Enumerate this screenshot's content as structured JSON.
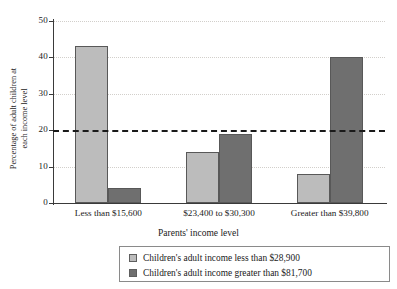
{
  "chart_data": {
    "type": "bar",
    "title": "",
    "xlabel": "Parents' income level",
    "ylabel": "Percentage of adult children at each income level",
    "ylabel_line1": "Percentage of adult children at",
    "ylabel_line2": "each income level",
    "categories": [
      "Less than $15,600",
      "$23,400 to $30,300",
      "Greater than $39,800"
    ],
    "series": [
      {
        "name": "Children's adult income less than $28,900",
        "color": "#bcbcbc",
        "values": [
          43,
          14,
          8
        ]
      },
      {
        "name": "Children's adult income greater than $81,700",
        "color": "#6f6f6f",
        "values": [
          4,
          19,
          40
        ]
      }
    ],
    "ylim": [
      0,
      50
    ],
    "yticks": [
      0,
      10,
      20,
      30,
      40,
      50
    ],
    "ytick_labels": [
      "0",
      "10",
      "20",
      "30",
      "40",
      "50"
    ],
    "grid": true,
    "reference_line": 20,
    "legend_position": "bottom"
  },
  "legend": {
    "items": [
      {
        "label": "Children's adult income less than $28,900",
        "color": "#bcbcbc"
      },
      {
        "label": "Children's adult income greater than $81,700",
        "color": "#6f6f6f"
      }
    ]
  },
  "colors": {
    "light_bar": "#bcbcbc",
    "dark_bar": "#6f6f6f",
    "bar_border": "#585858",
    "axis": "#3a3a3a",
    "gridline": "#d2cfcb",
    "reference_line": "#1a1a1a",
    "legend_border": "#8a8a8a",
    "background": "#ffffff"
  }
}
